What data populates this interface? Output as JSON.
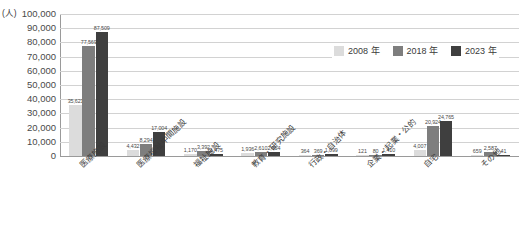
{
  "chart_data": {
    "type": "bar",
    "title": "",
    "subtitle": "",
    "xlabel": "",
    "ylabel": "(人)",
    "unit_caption": "(人)",
    "ylim": [
      0,
      100000
    ],
    "ytick_step": 10000,
    "grid": true,
    "legend_position": "upper-right-inside",
    "categories": [
      "医療施設",
      "医療福祉中間施設",
      "福祉施設",
      "教育・研究施設",
      "行政・自治体",
      "企業・起業・公的",
      "自宅",
      "その他"
    ],
    "ytick_labels": [
      "100,000",
      "90,000",
      "80,000",
      "70,000",
      "60,000",
      "50,000",
      "40,000",
      "30,000",
      "20,000",
      "10,000",
      "0"
    ],
    "ytick_values": [
      100000,
      90000,
      80000,
      70000,
      60000,
      50000,
      40000,
      30000,
      20000,
      10000,
      0
    ],
    "series": [
      {
        "name": "2008 年",
        "color": "#dcdcdc",
        "values": [
          35621,
          4432,
          1170,
          1936,
          364,
          121,
          4007,
          659
        ],
        "labels": [
          "35,621",
          "4,432",
          "1,170",
          "1,936",
          "364",
          "121",
          "4,007",
          "659"
        ]
      },
      {
        "name": "2018 年",
        "color": "#7e7e7e",
        "values": [
          77569,
          8294,
          3392,
          2610,
          369,
          80,
          20924,
          2587
        ],
        "labels": [
          "77,569",
          "8,294",
          "3,392",
          "2,610",
          "369",
          "80",
          "20,924",
          "2,587"
        ]
      },
      {
        "name": "2023 年",
        "color": "#3f3f3f",
        "values": [
          87509,
          17004,
          1475,
          2954,
          1099,
          1410,
          24765,
          41
        ],
        "labels": [
          "87,509",
          "17,004",
          "1,475",
          "2,954",
          "1,099",
          "1,410",
          "24,765",
          "41"
        ]
      }
    ]
  },
  "legend": {
    "items": [
      {
        "label": "2008 年",
        "color": "#dcdcdc"
      },
      {
        "label": "2018 年",
        "color": "#7e7e7e"
      },
      {
        "label": "2023 年",
        "color": "#3f3f3f"
      }
    ]
  },
  "colors": {
    "series_2008": "#dcdcdc",
    "series_2018": "#7e7e7e",
    "series_2023": "#3f3f3f",
    "gridline": "#d2d2d2",
    "axis": "#9a9a9a",
    "text": "#3a3a3a",
    "background": "#ffffff"
  }
}
